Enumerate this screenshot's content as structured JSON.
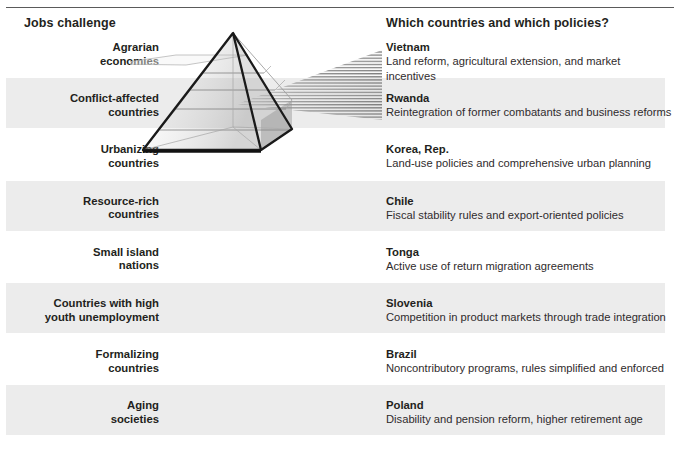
{
  "figure": {
    "header_left": "Jobs challenge",
    "header_right": "Which countries and which policies?",
    "top_faint_text": "",
    "accent_band_color": "#ececec",
    "rule_color": "#5a5a5a",
    "text_color": "#231f20"
  },
  "rows": [
    {
      "challenge_line1": "Agrarian",
      "challenge_line2": "economies",
      "country": "Vietnam",
      "policy": "Land reform, agricultural extension, and market incentives",
      "banded": false
    },
    {
      "challenge_line1": "Conflict-affected",
      "challenge_line2": "countries",
      "country": "Rwanda",
      "policy": "Reintegration of former combatants and business reforms",
      "banded": true
    },
    {
      "challenge_line1": "Urbanizing",
      "challenge_line2": "countries",
      "country": "Korea, Rep.",
      "policy": "Land-use policies and comprehensive urban planning",
      "banded": false
    },
    {
      "challenge_line1": "Resource-rich",
      "challenge_line2": "countries",
      "country": "Chile",
      "policy": "Fiscal stability rules and export-oriented policies",
      "banded": true
    },
    {
      "challenge_line1": "Small island",
      "challenge_line2": "nations",
      "country": "Tonga",
      "policy": "Active use of return migration agreements",
      "banded": false
    },
    {
      "challenge_line1": "Countries with high",
      "challenge_line2": "youth unemployment",
      "country": "Slovenia",
      "policy": "Competition in product markets through trade integration",
      "banded": true
    },
    {
      "challenge_line1": "Formalizing",
      "challenge_line2": "countries",
      "country": "Brazil",
      "policy": "Noncontributory programs, rules simplified and enforced",
      "banded": false
    },
    {
      "challenge_line1": "Aging",
      "challenge_line2": "societies",
      "country": "Poland",
      "policy": "Disability and pension reform, higher retirement age",
      "banded": true
    }
  ],
  "graphic": {
    "name": "glass-pyramid-with-light-rays",
    "description": "Wireframe three-dimensional glass pyramid with horizontal internal layers and a fan of light rays projecting to the right"
  }
}
